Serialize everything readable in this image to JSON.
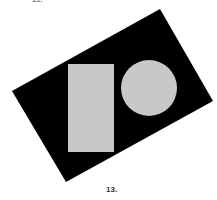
{
  "figure": {
    "top_label": "11.",
    "bottom_label": "13.",
    "colors": {
      "background": "#ffffff",
      "board": "#000000",
      "shape_fill": "#c8c8c8"
    },
    "shapes": [
      {
        "type": "rotated-rectangle-board",
        "color": "black"
      },
      {
        "type": "rectangle",
        "color": "light-gray"
      },
      {
        "type": "circle",
        "color": "light-gray"
      }
    ]
  }
}
